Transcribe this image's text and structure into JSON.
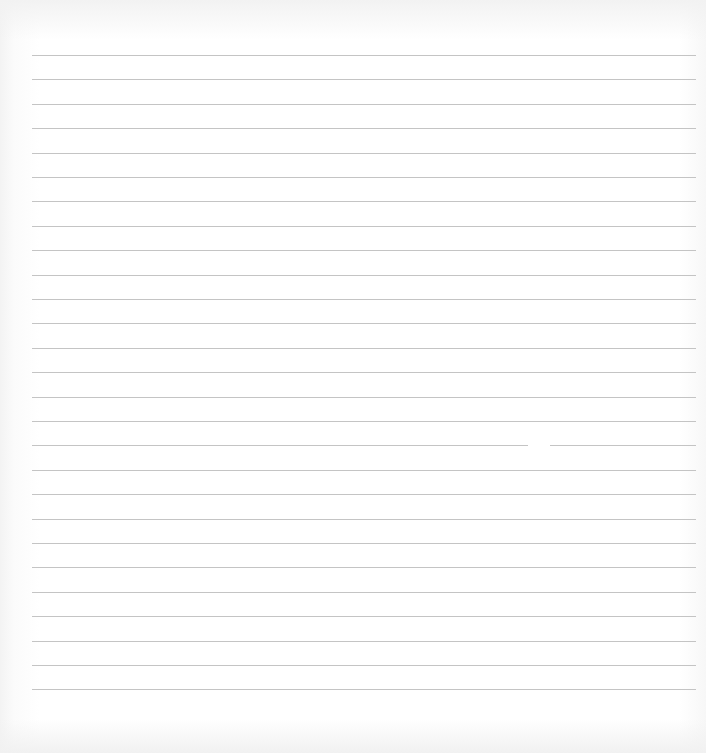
{
  "sheet": {
    "type": "lined-paper",
    "background_color": "#ffffff",
    "rule_color": "#c4c4c4",
    "rule_count": 27,
    "rule_left": 32,
    "rule_right": 696,
    "first_rule_y": 55,
    "rule_spacing": 24.4,
    "gap": {
      "rule_index": 16,
      "x": 528,
      "width": 22
    }
  }
}
